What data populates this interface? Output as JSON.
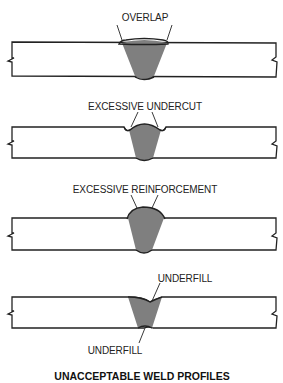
{
  "diagram": {
    "title": "UNACCEPTABLE WELD PROFILES",
    "colors": {
      "weld_fill": "#7f7f7f",
      "outline": "#222222",
      "plate_fill": "#ffffff"
    },
    "profiles": [
      {
        "id": "overlap",
        "label": "OVERLAP"
      },
      {
        "id": "excessive-undercut",
        "label": "EXCESSIVE UNDERCUT"
      },
      {
        "id": "excessive-reinforcement",
        "label": "EXCESSIVE REINFORCEMENT"
      },
      {
        "id": "underfill",
        "label": "UNDERFILL",
        "label_bottom": "UNDERFILL"
      }
    ]
  }
}
